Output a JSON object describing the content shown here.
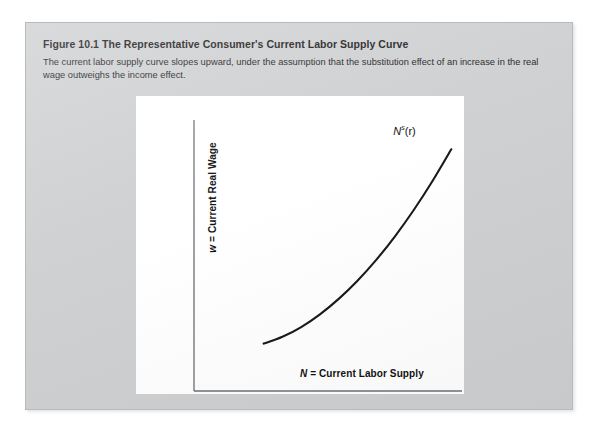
{
  "figure": {
    "number": "Figure 10.1",
    "title": "The Representative Consumer's Current Labor Supply Curve",
    "description": "The current labor supply curve slopes upward, under the assumption that the substitution effect of an increase in the real wage outweighs the income effect.",
    "panel_color": "#cfd0d2",
    "plot_background": "#ffffff",
    "curve_color": "#1a1a1a"
  },
  "chart_data": {
    "type": "line",
    "title": "The Representative Consumer's Current Labor Supply Curve",
    "xlabel": "N = Current Labor Supply",
    "ylabel": "w = Current Real Wage",
    "xlabel_var": "N",
    "xlabel_rest": " = Current Labor Supply",
    "ylabel_var": "w",
    "ylabel_rest": " = Current Real Wage",
    "grid": false,
    "legend": "none",
    "axis_ticks": [],
    "xlim": [
      0,
      1
    ],
    "ylim": [
      0,
      1
    ],
    "series": [
      {
        "name": "N^s(r)",
        "label_base": "N",
        "label_sup": "s",
        "label_arg": "(r)",
        "x": [
          0.26,
          0.33,
          0.4,
          0.47,
          0.54,
          0.61,
          0.68,
          0.75,
          0.82,
          0.89,
          0.96
        ],
        "y": [
          0.175,
          0.2,
          0.236,
          0.283,
          0.34,
          0.407,
          0.484,
          0.571,
          0.668,
          0.775,
          0.892
        ]
      }
    ]
  }
}
